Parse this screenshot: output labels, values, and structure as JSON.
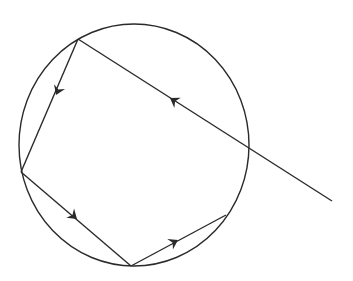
{
  "diagram": {
    "colors": {
      "stroke": "#2a2a2a",
      "background": "#ffffff"
    },
    "circle": {
      "cx": 134,
      "cy": 145,
      "rx": 115,
      "ry": 121
    },
    "external_ray": {
      "from": [
        332,
        201
      ],
      "to": [
        78,
        39
      ]
    },
    "reflection_points": [
      [
        78,
        39
      ],
      [
        21,
        172
      ],
      [
        131,
        266
      ],
      [
        226,
        215
      ]
    ],
    "arrows": [
      {
        "x": 171,
        "y": 99,
        "direction": "up-left"
      },
      {
        "x": 58,
        "y": 89,
        "direction": "down-left"
      },
      {
        "x": 69,
        "y": 214,
        "direction": "down-right"
      },
      {
        "x": 167,
        "y": 244,
        "direction": "up-right"
      }
    ]
  }
}
